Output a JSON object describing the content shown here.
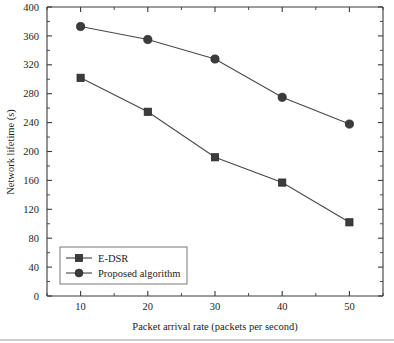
{
  "chart_data": {
    "type": "line",
    "title": "",
    "xlabel": "Packet arrival rate (packets per second)",
    "ylabel": "Network lifetime (s)",
    "x": [
      10,
      20,
      30,
      40,
      50
    ],
    "xlim": [
      5,
      55
    ],
    "ylim": [
      0,
      400
    ],
    "xticks": [
      10,
      20,
      30,
      40,
      50
    ],
    "yticks": [
      0,
      40,
      80,
      120,
      160,
      200,
      240,
      280,
      320,
      360,
      400
    ],
    "xtick_labels": [
      "10",
      "20",
      "30",
      "40",
      "50"
    ],
    "ytick_labels": [
      "0",
      "40",
      "80",
      "120",
      "160",
      "200",
      "240",
      "280",
      "320",
      "360",
      "400"
    ],
    "minor_ticks": true,
    "grid": false,
    "legend_position": "lower-left",
    "series": [
      {
        "name": "E-DSR",
        "marker": "square",
        "color": "#3c3c3c",
        "values": [
          302,
          255,
          192,
          157,
          102
        ]
      },
      {
        "name": "Proposed algorithm",
        "marker": "circle",
        "color": "#3c3c3c",
        "values": [
          373,
          355,
          328,
          275,
          238
        ]
      }
    ]
  },
  "legend": {
    "items": [
      {
        "label": "E-DSR",
        "marker": "square"
      },
      {
        "label": "Proposed algorithm",
        "marker": "circle"
      }
    ]
  },
  "axes": {
    "x_title": "Packet arrival rate (packets per second)",
    "y_title": "Network lifetime (s)"
  }
}
